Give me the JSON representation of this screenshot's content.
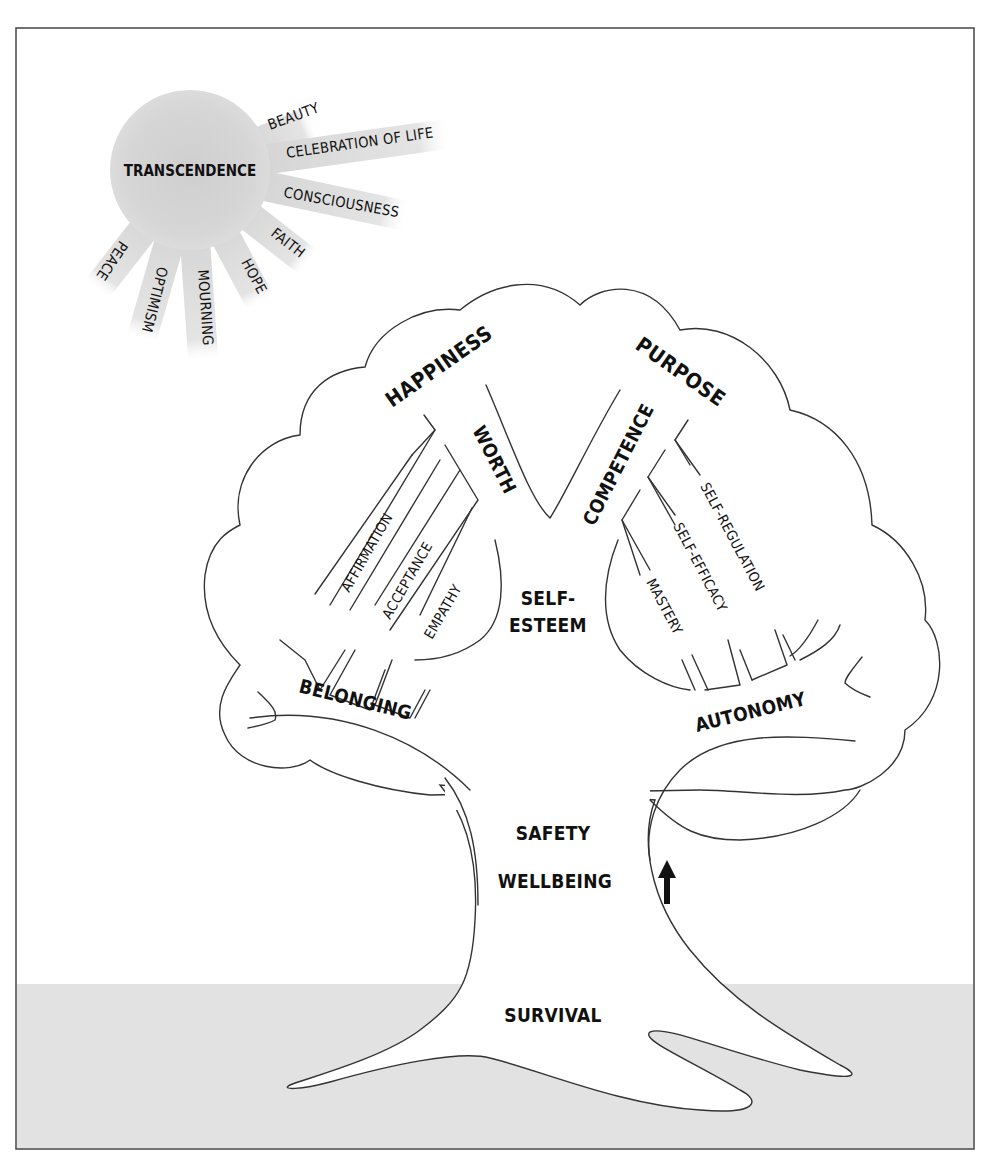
{
  "diagram": {
    "colors": {
      "frame": "#444444",
      "ground": "#e2e2e2",
      "sun": "#d6d6d6",
      "outline": "#333333",
      "text": "#111111"
    },
    "sun": {
      "center_label": "TRANSCENDENCE",
      "rays": [
        {
          "label": "BEAUTY"
        },
        {
          "label": "CELEBRATION OF LIFE"
        },
        {
          "label": "CONSCIOUSNESS"
        },
        {
          "label": "FAITH"
        },
        {
          "label": "HOPE"
        },
        {
          "label": "MOURNING"
        },
        {
          "label": "OPTIMISM"
        },
        {
          "label": "PEACE"
        }
      ]
    },
    "canopy": {
      "top_left": "HAPPINESS",
      "top_right": "PURPOSE",
      "left_branch": "WORTH",
      "right_branch": "COMPETENCE",
      "center": [
        "SELF-",
        "ESTEEM"
      ],
      "left_twigs": [
        "AFFIRMATION",
        "ACCEPTANCE",
        "EMPATHY"
      ],
      "right_twigs": [
        "SELF-REGULATION",
        "SELF-EFFICACY",
        "MASTERY"
      ],
      "lower_left": "BELONGING",
      "lower_right": "AUTONOMY"
    },
    "trunk": {
      "labels": [
        "SAFETY",
        "WELLBEING"
      ],
      "arrow": "arrow-up-icon"
    },
    "roots": {
      "label": "SURVIVAL"
    }
  }
}
